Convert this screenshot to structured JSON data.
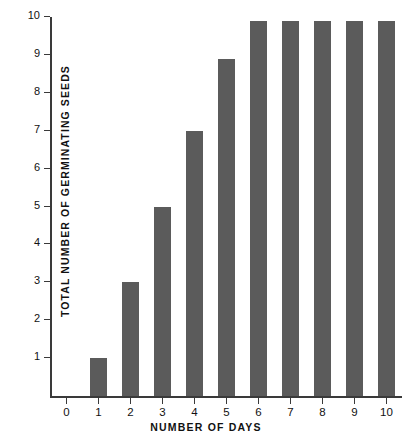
{
  "chart_data": {
    "type": "bar",
    "title": "",
    "subtitle": "",
    "xlabel": "NUMBER OF DAYS",
    "ylabel": "TOTAL NUMBER OF GERMINATING SEEDS",
    "categories": [
      "0",
      "1",
      "2",
      "3",
      "4",
      "5",
      "6",
      "7",
      "8",
      "9",
      "10"
    ],
    "values": [
      0,
      1,
      3,
      5,
      7,
      8.9,
      9.9,
      9.9,
      9.9,
      9.9,
      9.9
    ],
    "series": [
      {
        "name": "Total number of germinating seeds",
        "values": [
          0,
          1,
          3,
          5,
          7,
          8.9,
          9.9,
          9.9,
          9.9,
          9.9,
          9.9
        ]
      }
    ],
    "xlim": [
      0,
      11
    ],
    "ylim": [
      0,
      10
    ],
    "x_ticks": [
      "0",
      "1",
      "2",
      "3",
      "4",
      "5",
      "6",
      "7",
      "8",
      "9",
      "10"
    ],
    "y_ticks": [
      "1",
      "2",
      "3",
      "4",
      "5",
      "6",
      "7",
      "8",
      "9",
      "10"
    ],
    "grid": false,
    "legend": false,
    "legend_position": "none",
    "bar_color": "#5b5b5b",
    "axis_color": "#3a3a3a",
    "background_color": "#ffffff"
  },
  "axes": {
    "y_title": "TOTAL NUMBER OF GERMINATING SEEDS",
    "x_title": "NUMBER OF DAYS"
  }
}
